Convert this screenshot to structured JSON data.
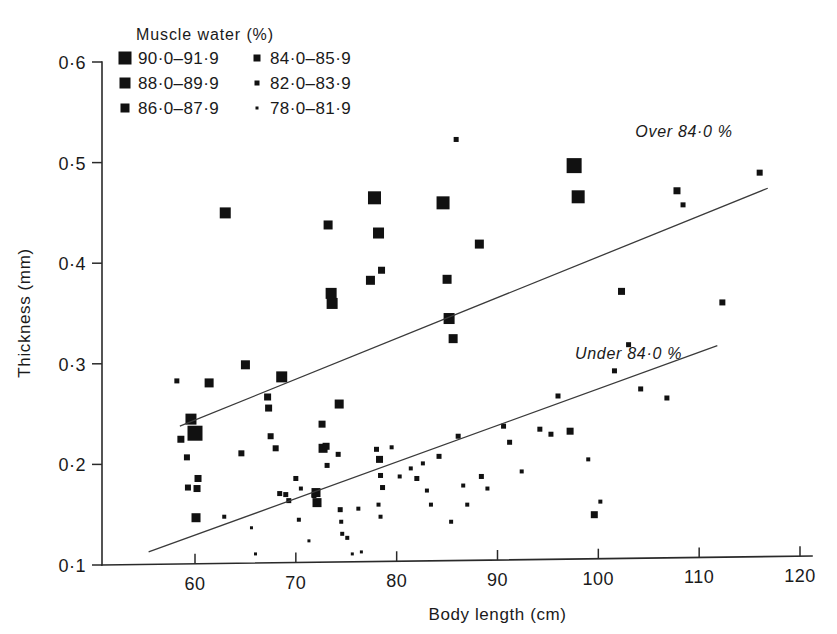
{
  "chart_data": {
    "type": "scatter",
    "title": "",
    "xlabel": "Body length (cm)",
    "ylabel": "Thickness (mm)",
    "xlim": [
      55,
      120
    ],
    "ylim": [
      0.1,
      0.6
    ],
    "xticks": [
      "60",
      "70",
      "80",
      "90",
      "100",
      "110",
      "120"
    ],
    "xtick_values": [
      60,
      70,
      80,
      90,
      100,
      110,
      120
    ],
    "yticks": [
      "0·6",
      "0·5",
      "0·4",
      "0·3",
      "0·2",
      "0·1"
    ],
    "ytick_values": [
      0.6,
      0.5,
      0.4,
      0.3,
      0.2,
      0.1
    ],
    "grid": false,
    "legend_position": "top-left-inside",
    "legend_title": "Muscle water (%)",
    "legend": [
      {
        "label": "90·0–91·9",
        "size": 13
      },
      {
        "label": "88·0–89·9",
        "size": 11
      },
      {
        "label": "86·0–87·9",
        "size": 9
      },
      {
        "label": "84·0–85·9",
        "size": 7
      },
      {
        "label": "82·0–83·9",
        "size": 5
      },
      {
        "label": "78·0–81·9",
        "size": 3
      }
    ],
    "annotations": [
      {
        "text": "Over 84·0 %",
        "x": 108.5,
        "y": 0.525
      },
      {
        "text": "Under 84·0 %",
        "x": 103.0,
        "y": 0.305
      }
    ],
    "trendlines": [
      {
        "name": "Over 84·0 %",
        "x1": 58.5,
        "y1": 0.238,
        "x2": 116.8,
        "y2": 0.4745
      },
      {
        "name": "Under 84·0 %",
        "x1": 55.4,
        "y1": 0.113,
        "x2": 111.8,
        "y2": 0.318
      }
    ],
    "points": [
      {
        "x": 58.2,
        "y": 0.283,
        "size": 5
      },
      {
        "x": 58.6,
        "y": 0.225,
        "size": 7
      },
      {
        "x": 59.6,
        "y": 0.245,
        "size": 11
      },
      {
        "x": 60.0,
        "y": 0.231,
        "size": 15
      },
      {
        "x": 59.2,
        "y": 0.207,
        "size": 6
      },
      {
        "x": 59.3,
        "y": 0.177,
        "size": 6
      },
      {
        "x": 60.2,
        "y": 0.176,
        "size": 7
      },
      {
        "x": 60.3,
        "y": 0.186,
        "size": 7
      },
      {
        "x": 60.1,
        "y": 0.147,
        "size": 9
      },
      {
        "x": 61.4,
        "y": 0.281,
        "size": 9
      },
      {
        "x": 63.0,
        "y": 0.45,
        "size": 11
      },
      {
        "x": 62.9,
        "y": 0.148,
        "size": 4
      },
      {
        "x": 64.6,
        "y": 0.211,
        "size": 6
      },
      {
        "x": 65.0,
        "y": 0.299,
        "size": 9
      },
      {
        "x": 65.6,
        "y": 0.137,
        "size": 3
      },
      {
        "x": 66.0,
        "y": 0.111,
        "size": 3
      },
      {
        "x": 67.2,
        "y": 0.267,
        "size": 7
      },
      {
        "x": 67.3,
        "y": 0.256,
        "size": 7
      },
      {
        "x": 67.5,
        "y": 0.228,
        "size": 6
      },
      {
        "x": 68.0,
        "y": 0.216,
        "size": 6
      },
      {
        "x": 68.6,
        "y": 0.287,
        "size": 11
      },
      {
        "x": 68.4,
        "y": 0.171,
        "size": 5
      },
      {
        "x": 69.0,
        "y": 0.17,
        "size": 5
      },
      {
        "x": 69.3,
        "y": 0.164,
        "size": 5
      },
      {
        "x": 70.0,
        "y": 0.186,
        "size": 5
      },
      {
        "x": 70.5,
        "y": 0.176,
        "size": 4
      },
      {
        "x": 70.3,
        "y": 0.145,
        "size": 4
      },
      {
        "x": 71.3,
        "y": 0.124,
        "size": 3
      },
      {
        "x": 71.8,
        "y": 0.169,
        "size": 5
      },
      {
        "x": 72.0,
        "y": 0.172,
        "size": 9
      },
      {
        "x": 72.1,
        "y": 0.162,
        "size": 9
      },
      {
        "x": 72.6,
        "y": 0.24,
        "size": 7
      },
      {
        "x": 72.7,
        "y": 0.216,
        "size": 9
      },
      {
        "x": 73.0,
        "y": 0.218,
        "size": 7
      },
      {
        "x": 73.1,
        "y": 0.199,
        "size": 5
      },
      {
        "x": 73.2,
        "y": 0.438,
        "size": 9
      },
      {
        "x": 73.5,
        "y": 0.37,
        "size": 11
      },
      {
        "x": 73.6,
        "y": 0.36,
        "size": 11
      },
      {
        "x": 74.3,
        "y": 0.26,
        "size": 9
      },
      {
        "x": 74.2,
        "y": 0.21,
        "size": 5
      },
      {
        "x": 74.4,
        "y": 0.155,
        "size": 5
      },
      {
        "x": 74.5,
        "y": 0.143,
        "size": 4
      },
      {
        "x": 74.6,
        "y": 0.131,
        "size": 4
      },
      {
        "x": 75.1,
        "y": 0.127,
        "size": 4
      },
      {
        "x": 75.6,
        "y": 0.111,
        "size": 3
      },
      {
        "x": 76.2,
        "y": 0.156,
        "size": 4
      },
      {
        "x": 76.5,
        "y": 0.113,
        "size": 3
      },
      {
        "x": 77.4,
        "y": 0.383,
        "size": 9
      },
      {
        "x": 77.8,
        "y": 0.465,
        "size": 13
      },
      {
        "x": 78.2,
        "y": 0.43,
        "size": 11
      },
      {
        "x": 78.5,
        "y": 0.393,
        "size": 7
      },
      {
        "x": 78.0,
        "y": 0.215,
        "size": 5
      },
      {
        "x": 78.3,
        "y": 0.205,
        "size": 7
      },
      {
        "x": 78.4,
        "y": 0.189,
        "size": 5
      },
      {
        "x": 78.6,
        "y": 0.177,
        "size": 5
      },
      {
        "x": 78.2,
        "y": 0.16,
        "size": 4
      },
      {
        "x": 78.4,
        "y": 0.148,
        "size": 4
      },
      {
        "x": 79.5,
        "y": 0.217,
        "size": 4
      },
      {
        "x": 80.3,
        "y": 0.188,
        "size": 4
      },
      {
        "x": 81.4,
        "y": 0.196,
        "size": 4
      },
      {
        "x": 82.0,
        "y": 0.186,
        "size": 5
      },
      {
        "x": 82.6,
        "y": 0.201,
        "size": 4
      },
      {
        "x": 83.0,
        "y": 0.174,
        "size": 4
      },
      {
        "x": 83.4,
        "y": 0.16,
        "size": 4
      },
      {
        "x": 84.2,
        "y": 0.208,
        "size": 5
      },
      {
        "x": 84.6,
        "y": 0.46,
        "size": 13
      },
      {
        "x": 85.0,
        "y": 0.384,
        "size": 9
      },
      {
        "x": 85.2,
        "y": 0.345,
        "size": 11
      },
      {
        "x": 85.6,
        "y": 0.325,
        "size": 9
      },
      {
        "x": 85.9,
        "y": 0.523,
        "size": 5
      },
      {
        "x": 85.4,
        "y": 0.143,
        "size": 4
      },
      {
        "x": 86.1,
        "y": 0.228,
        "size": 5
      },
      {
        "x": 86.6,
        "y": 0.179,
        "size": 4
      },
      {
        "x": 87.0,
        "y": 0.16,
        "size": 4
      },
      {
        "x": 88.2,
        "y": 0.419,
        "size": 9
      },
      {
        "x": 88.4,
        "y": 0.188,
        "size": 5
      },
      {
        "x": 89.0,
        "y": 0.176,
        "size": 4
      },
      {
        "x": 90.6,
        "y": 0.238,
        "size": 5
      },
      {
        "x": 91.2,
        "y": 0.222,
        "size": 5
      },
      {
        "x": 92.4,
        "y": 0.193,
        "size": 4
      },
      {
        "x": 94.2,
        "y": 0.235,
        "size": 5
      },
      {
        "x": 95.3,
        "y": 0.23,
        "size": 5
      },
      {
        "x": 96.0,
        "y": 0.268,
        "size": 5
      },
      {
        "x": 97.6,
        "y": 0.497,
        "size": 15
      },
      {
        "x": 98.0,
        "y": 0.466,
        "size": 13
      },
      {
        "x": 97.2,
        "y": 0.233,
        "size": 7
      },
      {
        "x": 99.0,
        "y": 0.205,
        "size": 4
      },
      {
        "x": 99.6,
        "y": 0.15,
        "size": 7
      },
      {
        "x": 100.2,
        "y": 0.163,
        "size": 4
      },
      {
        "x": 101.6,
        "y": 0.293,
        "size": 5
      },
      {
        "x": 102.3,
        "y": 0.372,
        "size": 7
      },
      {
        "x": 103.0,
        "y": 0.319,
        "size": 5
      },
      {
        "x": 104.2,
        "y": 0.275,
        "size": 5
      },
      {
        "x": 106.8,
        "y": 0.266,
        "size": 5
      },
      {
        "x": 107.8,
        "y": 0.472,
        "size": 7
      },
      {
        "x": 108.4,
        "y": 0.458,
        "size": 5
      },
      {
        "x": 112.3,
        "y": 0.361,
        "size": 6
      },
      {
        "x": 116.0,
        "y": 0.49,
        "size": 6
      }
    ]
  }
}
